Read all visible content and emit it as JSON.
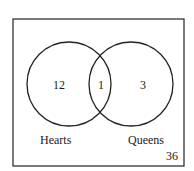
{
  "diagram": {
    "type": "venn",
    "universe_count": "36",
    "sets": [
      {
        "name": "Hearts",
        "only_count": "12"
      },
      {
        "name": "Queens",
        "only_count": "3"
      }
    ],
    "intersection_count": "1"
  }
}
